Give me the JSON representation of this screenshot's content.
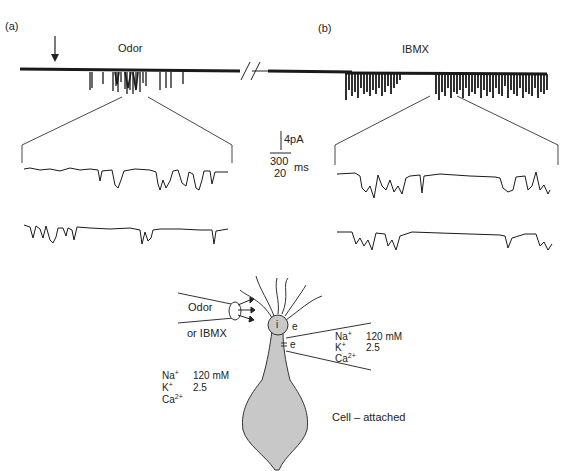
{
  "panels": {
    "a": {
      "label": "(a)",
      "stimulus": "Odor"
    },
    "b": {
      "label": "(b)",
      "stimulus": "IBMX"
    }
  },
  "scale_bar": {
    "current": "4pA",
    "time_top": "300",
    "time_bottom": "20",
    "time_unit": "ms"
  },
  "diagram": {
    "pipette_label_1": "Odor",
    "pipette_label_2": "or IBMX",
    "inside_label": "i",
    "electrode_label_1": "e",
    "electrode_label_2": "e",
    "recording_mode": "Cell – attached",
    "bath_solution": {
      "na_label": "Na",
      "na_charge": "+",
      "na_value": "120 mM",
      "k_label": "K",
      "k_charge": "+",
      "k_value": "2.5",
      "ca_label": "Ca",
      "ca_charge": "2+"
    },
    "pipette_solution": {
      "na_label": "Na",
      "na_charge": "+",
      "na_value": "120 mM",
      "k_label": "K",
      "k_charge": "+",
      "k_value": "2.5",
      "ca_label": "Ca",
      "ca_charge": "2+"
    }
  },
  "colors": {
    "trace": "#1a1a1a",
    "cell_fill": "#c8c8c8",
    "line": "#333333"
  }
}
